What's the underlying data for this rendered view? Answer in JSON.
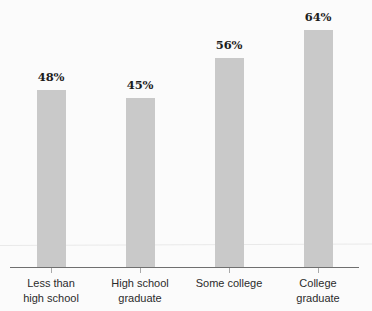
{
  "chart_data": {
    "type": "bar",
    "title": "",
    "subtitle": "",
    "xlabel": "",
    "ylabel": "",
    "ylim": [
      0,
      72
    ],
    "grid": false,
    "legend": null,
    "categories": [
      "Less than high school",
      "High school graduate",
      "Some college",
      "College graduate"
    ],
    "category_lines": [
      [
        "Less than",
        "high school"
      ],
      [
        "High school",
        "graduate"
      ],
      [
        "Some college",
        ""
      ],
      [
        "College",
        "graduate"
      ]
    ],
    "values": [
      48,
      45,
      56,
      64
    ],
    "value_labels": [
      "48%",
      "45%",
      "56%",
      "64%"
    ],
    "series": [
      {
        "name": "",
        "values": [
          48,
          45,
          56,
          64
        ]
      }
    ],
    "bar_color": "#c9c9c9",
    "axis_color": "#6f6f6f",
    "gridline_color": "#e9e9e9",
    "label_color": "#2b2b2b",
    "value_label_color": "#1d1d1d",
    "background_color": "#fbfbfb"
  }
}
